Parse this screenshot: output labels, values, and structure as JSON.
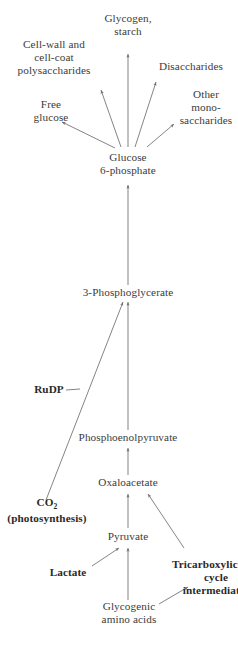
{
  "diagram": {
    "background_color": "#ffffff",
    "line_color": "#6e6e6e",
    "text_color": "#3b3b3b",
    "nodes": {
      "glycogen_starch": "Glycogen,\nstarch",
      "cell_wall_polysaccharides": "Cell-wall and\ncell-coat\npolysaccharides",
      "disaccharides": "Disaccharides",
      "free_glucose": "Free\nglucose",
      "other_monosaccharides": "Other\nmono-\nsaccharides",
      "glucose_6_phosphate": "Glucose\n6-phosphate",
      "phosphoglycerate": "3-Phosphoglycerate",
      "rudp": "RuDP",
      "phosphoenolpyruvate": "Phosphoenolpyruvate",
      "co2_label": "CO",
      "co2_subscript": "2",
      "co2_note": "(photosynthesis)",
      "oxaloacetate": "Oxaloacetate",
      "pyruvate": "Pyruvate",
      "lactate": "Lactate",
      "tricarboxylic_cycle": "Tricarboxylic acid\ncycle\nintermediates",
      "glycogenic_amino_acids": "Glycogenic\namino acids"
    }
  }
}
